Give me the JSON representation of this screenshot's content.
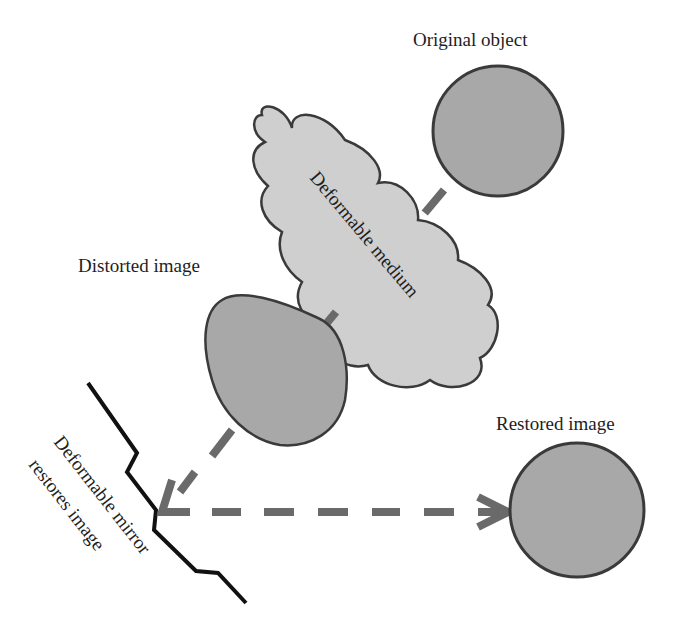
{
  "diagram": {
    "labels": {
      "original_object": "Original object",
      "deformable_medium": "Deformable medium",
      "distorted_image": "Distorted image",
      "restored_image": "Restored image",
      "mirror_line1": "Deformable mirror",
      "mirror_line2": "restores image"
    },
    "colors": {
      "object_fill": "#a8a8a8",
      "medium_fill": "#cfcfcf",
      "outline": "#3a3a3a",
      "arrow": "#6a6a6a",
      "mirror": "#111111",
      "text": "#1e1e1e"
    }
  }
}
